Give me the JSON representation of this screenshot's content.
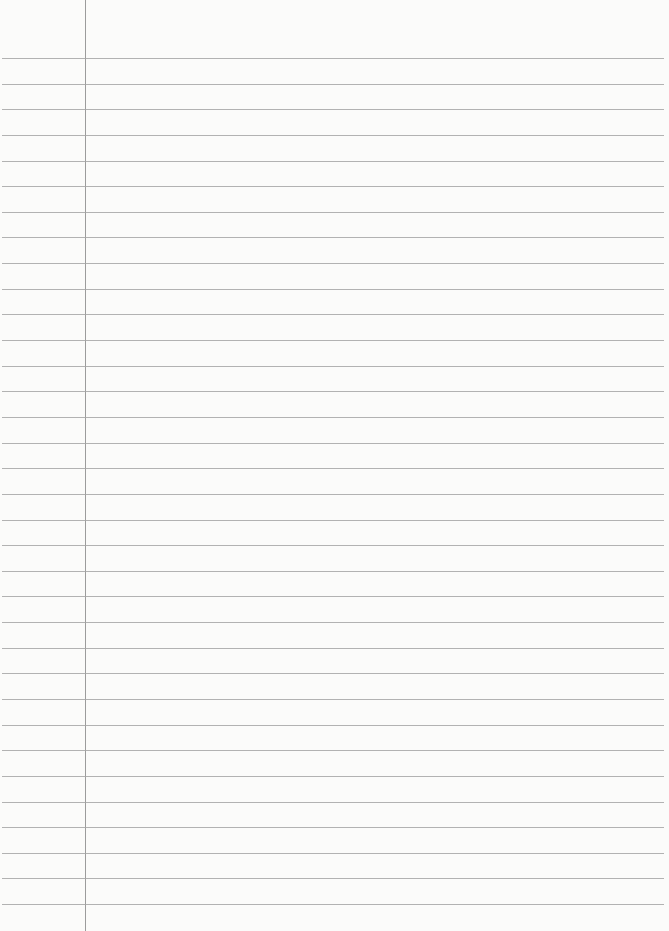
{
  "paper": {
    "type": "lined-notebook-page",
    "background_color": "#fbfbfa",
    "rule_color": "#a4a4a4",
    "margin_line_color": "#9c9c9c",
    "margin_line_x": 85,
    "first_rule_y": 58,
    "rule_spacing": 25.64,
    "rule_count": 34,
    "text": ""
  }
}
